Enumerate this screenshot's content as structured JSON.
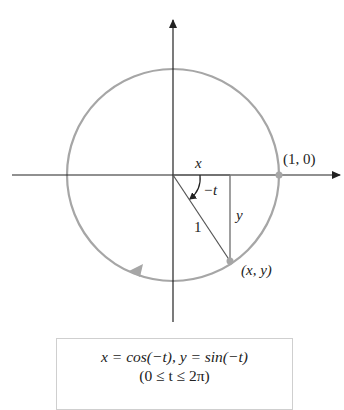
{
  "labels": {
    "x_segment": "x",
    "angle": "−t",
    "y_segment": "y",
    "radius": "1",
    "start_point": "(1, 0)",
    "moving_point": "(x, y)"
  },
  "equation_box": {
    "line1": "x = cos(−t), y = sin(−t)",
    "line2": "(0 ≤ t ≤ 2π)"
  },
  "colors": {
    "axis": "#222222",
    "circle": "#a6a6a6",
    "point": "#a6a6a6",
    "box_border": "#cfcfcf"
  }
}
